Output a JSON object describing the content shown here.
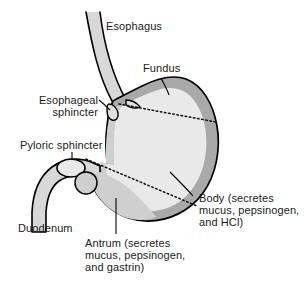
{
  "figure": {
    "background_color": "#ffffff",
    "outline_color": "#000000",
    "wall_color": "#a9a9a9",
    "lumen_color": "#e9e9e9",
    "mid_color": "#cfcfcf",
    "text_color": "#1a1a1a"
  },
  "labels": {
    "esophagus": "Esophagus",
    "fundus": "Fundus",
    "esophageal_sphincter_line1": "Esophageal",
    "esophageal_sphincter_line2": "sphincter",
    "pyloric_sphincter": "Pyloric sphincter",
    "duodenum": "Duodenum",
    "body_line1": "Body (secretes",
    "body_line2": "mucus, pepsinogen,",
    "body_line3": "and HCl)",
    "antrum_line1": "Antrum (secretes",
    "antrum_line2": "mucus, pepsinogen,",
    "antrum_line3": "and gastrin)"
  },
  "regions": [
    {
      "name": "esophagus",
      "label": "Esophagus"
    },
    {
      "name": "fundus",
      "label": "Fundus"
    },
    {
      "name": "esophageal-sphincter",
      "label": "Esophageal sphincter"
    },
    {
      "name": "pyloric-sphincter",
      "label": "Pyloric sphincter"
    },
    {
      "name": "duodenum",
      "label": "Duodenum"
    },
    {
      "name": "body",
      "label": "Body (secretes mucus, pepsinogen, and HCl)"
    },
    {
      "name": "antrum",
      "label": "Antrum (secretes mucus, pepsinogen, and gastrin)"
    }
  ]
}
